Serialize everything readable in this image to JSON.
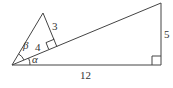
{
  "diagram": {
    "type": "geometry",
    "labels": {
      "small_leg_opposite": "3",
      "small_leg_adjacent": "4",
      "large_leg_vertical": "5",
      "large_leg_horizontal": "12",
      "angle_small": "β",
      "angle_large": "α"
    },
    "colors": {
      "stroke": "#444444",
      "text": "#333333",
      "background": "#ffffff"
    }
  }
}
